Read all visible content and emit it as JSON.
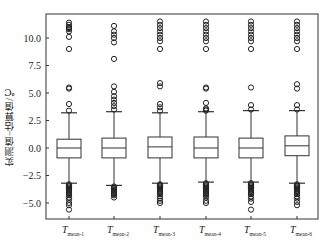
{
  "chart_data": {
    "type": "box",
    "title": "",
    "xlabel": "",
    "ylabel": "实测值−估算值/℃",
    "ylim": [
      -6.5,
      12.2
    ],
    "yticks": [
      -5.0,
      -2.5,
      0.0,
      2.5,
      5.0,
      7.5,
      10.0
    ],
    "ytick_labels": [
      "−5.0",
      "−2.5",
      "0.0",
      "2.5",
      "5.0",
      "7.5",
      "10.0"
    ],
    "grid": false,
    "legend": null,
    "categories": [
      "T_mean-1",
      "T_mean-2",
      "T_mean-3",
      "T_mean-4",
      "T_mean-5",
      "T_mean-6"
    ],
    "category_labels": [
      {
        "main": "T",
        "sub": "mean-1"
      },
      {
        "main": "T",
        "sub": "mean-2"
      },
      {
        "main": "T",
        "sub": "mean-3"
      },
      {
        "main": "T",
        "sub": "mean-4"
      },
      {
        "main": "T",
        "sub": "mean-5"
      },
      {
        "main": "T",
        "sub": "mean-6"
      }
    ],
    "boxes": [
      {
        "name": "T_mean-1",
        "whisker_low": -3.2,
        "q1": -0.9,
        "median": 0.0,
        "q3": 0.8,
        "whisker_high": 3.2,
        "outliers_high": [
          3.4,
          4.0,
          5.4,
          5.5,
          9.0,
          10.1,
          10.6,
          10.8,
          10.9,
          11.0,
          11.2,
          11.4
        ],
        "outliers_low": [
          -3.3,
          -3.4,
          -3.5,
          -3.6,
          -3.7,
          -3.8,
          -3.9,
          -4.0,
          -4.1,
          -4.2,
          -4.3,
          -4.5,
          -4.7,
          -5.0,
          -5.2,
          -5.6
        ]
      },
      {
        "name": "T_mean-2",
        "whisker_low": -3.4,
        "q1": -0.9,
        "median": 0.0,
        "q3": 0.9,
        "whisker_high": 3.3,
        "outliers_high": [
          3.5,
          3.8,
          4.1,
          4.4,
          4.7,
          5.1,
          5.6,
          8.1,
          9.6,
          10.0,
          10.3,
          10.6,
          11.1
        ],
        "outliers_low": [
          -3.5,
          -3.6,
          -3.7,
          -3.8,
          -3.9,
          -4.0,
          -4.1,
          -4.2,
          -4.3,
          -4.5
        ]
      },
      {
        "name": "T_mean-3",
        "whisker_low": -3.2,
        "q1": -0.9,
        "median": 0.1,
        "q3": 1.0,
        "whisker_high": 3.2,
        "outliers_high": [
          3.4,
          3.7,
          4.0,
          5.6,
          5.9,
          9.0,
          9.7,
          10.0,
          10.3,
          10.6,
          10.9,
          11.2,
          11.5
        ],
        "outliers_low": [
          -3.3,
          -3.4,
          -3.5,
          -3.6,
          -3.7,
          -3.8,
          -3.9,
          -4.0,
          -4.1,
          -4.2,
          -4.4,
          -4.6,
          -4.8,
          -5.0
        ]
      },
      {
        "name": "T_mean-4",
        "whisker_low": -3.1,
        "q1": -0.9,
        "median": 0.0,
        "q3": 1.0,
        "whisker_high": 3.3,
        "outliers_high": [
          3.4,
          3.5,
          3.6,
          4.1,
          5.4,
          5.5,
          9.0,
          9.7,
          10.0,
          10.3,
          10.6,
          10.9,
          11.2,
          11.5
        ],
        "outliers_low": [
          -3.2,
          -3.3,
          -3.4,
          -3.5,
          -3.6,
          -3.7,
          -3.8,
          -3.9,
          -4.0,
          -4.1,
          -4.2,
          -4.3,
          -4.5,
          -4.8,
          -5.0
        ]
      },
      {
        "name": "T_mean-5",
        "whisker_low": -3.1,
        "q1": -0.9,
        "median": 0.0,
        "q3": 0.9,
        "whisker_high": 3.4,
        "outliers_high": [
          3.5,
          3.9,
          5.5,
          9.0,
          9.7,
          10.0,
          10.3,
          10.6,
          10.9,
          11.2,
          11.5
        ],
        "outliers_low": [
          -3.2,
          -3.3,
          -3.4,
          -3.5,
          -3.6,
          -3.7,
          -3.8,
          -3.9,
          -4.0,
          -4.1,
          -4.2,
          -4.4,
          -4.6,
          -4.9,
          -5.6
        ]
      },
      {
        "name": "T_mean-6",
        "whisker_low": -3.2,
        "q1": -0.7,
        "median": 0.2,
        "q3": 1.1,
        "whisker_high": 3.4,
        "outliers_high": [
          3.5,
          3.9,
          5.4,
          5.8,
          9.0,
          9.7,
          10.0,
          10.3,
          10.6,
          10.9,
          11.2,
          11.5
        ],
        "outliers_low": [
          -3.3,
          -3.4,
          -3.5,
          -3.6,
          -3.7,
          -3.8,
          -3.9,
          -4.0,
          -4.1,
          -4.2,
          -4.4,
          -4.6,
          -4.9,
          -5.2
        ]
      }
    ]
  },
  "colors": {
    "axis": "#333333",
    "box_stroke": "#333333",
    "outlier_stroke": "#222222",
    "background": "#ffffff"
  },
  "layout": {
    "frame": {
      "x0": 46,
      "y0": 14,
      "x1": 318,
      "y1": 219
    },
    "y_zero_px": 148,
    "px_per_unit": 11,
    "box_centers": [
      69,
      114,
      160,
      206,
      251,
      297
    ],
    "box_width": 24,
    "cap_width": 16
  }
}
